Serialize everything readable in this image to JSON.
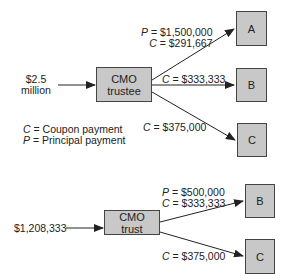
{
  "top_diagram": {
    "input": {
      "line1": "$2.5",
      "line2": "million"
    },
    "trustee": {
      "line1": "CMO",
      "line2": "trustee"
    },
    "tranches": [
      {
        "label": "A",
        "flow": {
          "p_var": "P",
          "p_value": "= $1,500,000",
          "c_var": "C",
          "c_value": "= $291,667"
        }
      },
      {
        "label": "B",
        "flow": {
          "c_var": "C",
          "c_value": "= $333,333"
        }
      },
      {
        "label": "C",
        "flow": {
          "c_var": "C",
          "c_value": "= $375,000"
        }
      }
    ],
    "legend": [
      {
        "var": "C",
        "text": "= Coupon payment"
      },
      {
        "var": "P",
        "text": "= Principal payment"
      }
    ]
  },
  "bottom_diagram": {
    "input": "$1,208,333",
    "trust": {
      "line1": "CMO",
      "line2": "trust"
    },
    "tranches": [
      {
        "label": "B",
        "flow": {
          "p_var": "P",
          "p_value": "= $500,000",
          "c_var": "C",
          "c_value": "= $333,333"
        }
      },
      {
        "label": "C",
        "flow": {
          "c_var": "C",
          "c_value": "= $375,000"
        }
      }
    ]
  },
  "colors": {
    "box_fill": "#c8c8c8",
    "box_border": "#444444",
    "line": "#222222"
  }
}
